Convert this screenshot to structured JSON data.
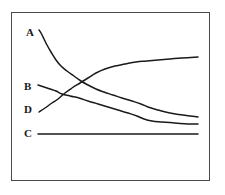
{
  "chart_data": {
    "type": "line",
    "title": "",
    "subtitle": "",
    "xlabel": "",
    "ylabel": "",
    "grid": false,
    "legend_position": "inline-left",
    "axis_ticks": [],
    "xlim": [
      0,
      100
    ],
    "ylim": [
      0,
      100
    ],
    "frame": {
      "border_color": "#4a4a4a",
      "background": "#ffffff"
    },
    "line_color": "#1a1a1a",
    "annotations": [],
    "series": [
      {
        "name": "A",
        "label": "A",
        "label_x": 26,
        "label_y": 27,
        "color": "#1a1a1a",
        "description": "steeply decreasing then flattening",
        "points": [
          [
            39,
            30
          ],
          [
            41,
            33
          ],
          [
            44,
            39
          ],
          [
            47,
            45
          ],
          [
            51,
            52
          ],
          [
            56,
            60
          ],
          [
            61,
            66
          ],
          [
            67,
            71
          ],
          [
            74,
            76
          ],
          [
            81,
            81
          ],
          [
            88,
            85
          ],
          [
            96,
            89
          ],
          [
            104,
            92
          ],
          [
            113,
            95
          ],
          [
            122,
            98
          ],
          [
            132,
            101
          ],
          [
            141,
            104
          ],
          [
            148,
            107
          ],
          [
            158,
            110
          ],
          [
            170,
            113
          ],
          [
            183,
            115
          ],
          [
            198,
            117
          ]
        ]
      },
      {
        "name": "B",
        "label": "B",
        "label_x": 24,
        "label_y": 81,
        "color": "#1a1a1a",
        "description": "gently decreasing",
        "points": [
          [
            38,
            85
          ],
          [
            44,
            87
          ],
          [
            50,
            89
          ],
          [
            56,
            91
          ],
          [
            62,
            94
          ],
          [
            70,
            96
          ],
          [
            79,
            98
          ],
          [
            88,
            101
          ],
          [
            98,
            104
          ],
          [
            108,
            107
          ],
          [
            118,
            110
          ],
          [
            128,
            113
          ],
          [
            137,
            116
          ],
          [
            144,
            119
          ],
          [
            152,
            121
          ],
          [
            162,
            122
          ],
          [
            175,
            123
          ],
          [
            188,
            124
          ],
          [
            198,
            124
          ]
        ]
      },
      {
        "name": "D",
        "label": "D",
        "label_x": 24,
        "label_y": 104,
        "color": "#1a1a1a",
        "description": "increasing then flattening",
        "points": [
          [
            39,
            112
          ],
          [
            45,
            108
          ],
          [
            52,
            103
          ],
          [
            58,
            99
          ],
          [
            65,
            93
          ],
          [
            72,
            88
          ],
          [
            80,
            83
          ],
          [
            88,
            78
          ],
          [
            96,
            73
          ],
          [
            105,
            69
          ],
          [
            115,
            66
          ],
          [
            125,
            64
          ],
          [
            136,
            62
          ],
          [
            147,
            61
          ],
          [
            158,
            60
          ],
          [
            170,
            59
          ],
          [
            182,
            58
          ],
          [
            198,
            57
          ]
        ]
      },
      {
        "name": "C",
        "label": "C",
        "label_x": 24,
        "label_y": 128,
        "color": "#1a1a1a",
        "description": "flat / constant",
        "points": [
          [
            38,
            134
          ],
          [
            60,
            134
          ],
          [
            90,
            134
          ],
          [
            120,
            134
          ],
          [
            150,
            134
          ],
          [
            175,
            134
          ],
          [
            198,
            134
          ]
        ]
      }
    ]
  }
}
